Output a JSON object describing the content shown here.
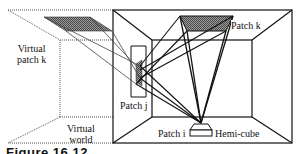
{
  "figure": {
    "caption": "Figure 16.12",
    "labels": {
      "virtual_patch_k": [
        "Virtual",
        "patch k"
      ],
      "virtual_world": [
        "Virtual",
        "world"
      ],
      "patch_k": "Patch k",
      "patch_j": "Patch j",
      "patch_i": "Patch i",
      "hemi_cube": "Hemi-cube"
    },
    "colors": {
      "line": "#111111",
      "dotted": "#555555",
      "patch_fill": "#7a7a7a",
      "background": "#ffffff"
    }
  }
}
